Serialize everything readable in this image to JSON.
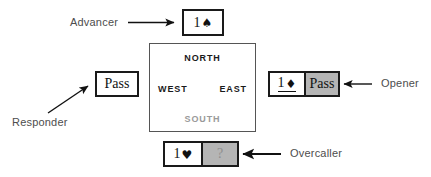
{
  "diagram": {
    "background_color": "#ffffff",
    "ink_color": "#1a1a1a",
    "highlight_color": "#b5b5b5",
    "label_color": "#4d4d4d"
  },
  "compass": {
    "north": "NORTH",
    "west": "WEST",
    "east": "EAST",
    "south": "SOUTH"
  },
  "roles": {
    "advancer": "Advancer",
    "responder": "Responder",
    "opener": "Opener",
    "overcaller": "Overcaller"
  },
  "bids": {
    "advancer_box": {
      "cells": [
        {
          "level": "1",
          "suit": "♠",
          "text": "1♠",
          "highlighted": false,
          "underlined": false
        }
      ]
    },
    "responder_box": {
      "cells": [
        {
          "text": "Pass",
          "highlighted": false,
          "underlined": false
        }
      ]
    },
    "opener_box": {
      "cells": [
        {
          "level": "1",
          "suit": "♦",
          "text": "1♦",
          "highlighted": false,
          "underlined": true
        },
        {
          "text": "Pass",
          "highlighted": true,
          "underlined": false
        }
      ]
    },
    "overcaller_box": {
      "cells": [
        {
          "level": "1",
          "suit": "♥",
          "text": "1♥",
          "highlighted": false,
          "underlined": false
        },
        {
          "text": "?",
          "highlighted": true,
          "underlined": false,
          "faint": true
        }
      ]
    }
  },
  "arrows": {
    "advancer_arrow": "arrow-right",
    "responder_arrow": "arrow-up-right",
    "opener_arrow": "arrow-left",
    "overcaller_arrow": "arrow-left"
  }
}
